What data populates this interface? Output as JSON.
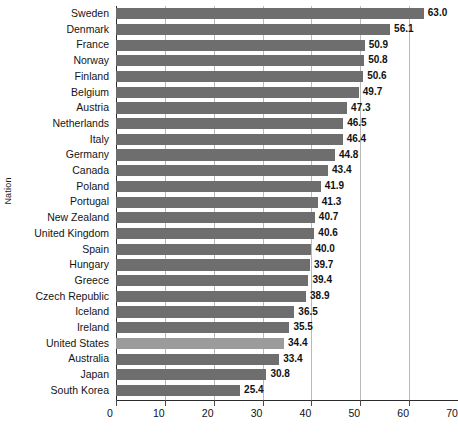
{
  "chart_data": {
    "type": "bar",
    "orientation": "horizontal",
    "title": "",
    "xlabel": "",
    "ylabel": "Nation",
    "xlim": [
      0,
      70
    ],
    "xticks": [
      0,
      10,
      20,
      30,
      40,
      50,
      60,
      70
    ],
    "grid": true,
    "legend": null,
    "categories": [
      "Sweden",
      "Denmark",
      "France",
      "Norway",
      "Finland",
      "Belgium",
      "Austria",
      "Netherlands",
      "Italy",
      "Germany",
      "Canada",
      "Poland",
      "Portugal",
      "New Zealand",
      "United Kingdom",
      "Spain",
      "Hungary",
      "Greece",
      "Czech Republic",
      "Iceland",
      "Ireland",
      "United States",
      "Australia",
      "Japan",
      "South Korea"
    ],
    "values": [
      63.0,
      56.1,
      50.9,
      50.8,
      50.6,
      49.7,
      47.3,
      46.5,
      46.4,
      44.8,
      43.4,
      41.9,
      41.3,
      40.7,
      40.6,
      40.0,
      39.7,
      39.4,
      38.9,
      36.5,
      35.5,
      34.4,
      33.4,
      30.8,
      25.4
    ],
    "value_labels": [
      "63.0",
      "56.1",
      "50.9",
      "50.8",
      "50.6",
      "49.7",
      "47.3",
      "46.5",
      "46.4",
      "44.8",
      "43.4",
      "41.9",
      "41.3",
      "40.7",
      "40.6",
      "40.0",
      "39.7",
      "39.4",
      "38.9",
      "36.5",
      "35.5",
      "34.4",
      "33.4",
      "30.8",
      "25.4"
    ],
    "highlighted_category": "United States",
    "colors": {
      "bar": "#6e6e6e",
      "bar_highlight": "#9b9b9b",
      "gridline": "#b9b9b9",
      "axis": "#2b2b2b",
      "text": "#111111",
      "background": "#ffffff"
    }
  }
}
